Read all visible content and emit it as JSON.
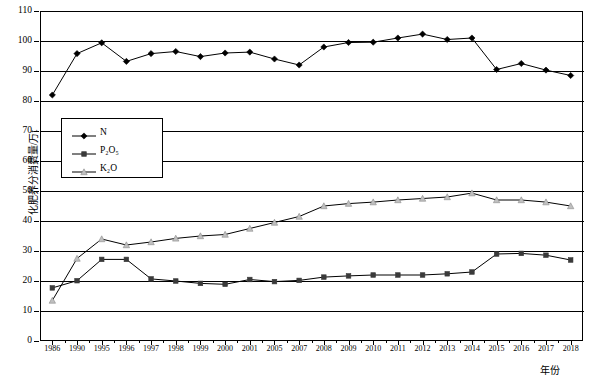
{
  "chart_data": {
    "type": "line",
    "title": "",
    "xlabel": "年份",
    "ylabel": "化肥养分消费量/万t",
    "ylim": [
      0,
      110
    ],
    "ytick_step": 10,
    "grid": true,
    "legend_position": "inside-upper-left",
    "categories": [
      "1986",
      "1990",
      "1995",
      "1996",
      "1997",
      "1998",
      "1999",
      "2000",
      "2001",
      "2005",
      "2007",
      "2008",
      "2009",
      "2010",
      "2011",
      "2012",
      "2013",
      "2014",
      "2015",
      "2016",
      "2017",
      "2018"
    ],
    "yticks": [
      "0",
      "10",
      "20",
      "30",
      "40",
      "50",
      "60",
      "70",
      "80",
      "90",
      "100",
      "110"
    ],
    "series": [
      {
        "name": "N",
        "marker": "diamond",
        "color": "#000000",
        "values": [
          82.0,
          95.8,
          99.4,
          93.2,
          95.8,
          96.5,
          94.8,
          96.0,
          96.3,
          94.0,
          92.0,
          98.0,
          99.5,
          99.6,
          101.0,
          102.3,
          100.5,
          101.0,
          90.5,
          92.5,
          90.3,
          88.5
        ]
      },
      {
        "name": "P2O5",
        "name_display": "P₂O₅",
        "marker": "square",
        "color": "#3a3a3a",
        "values": [
          17.7,
          20.1,
          27.2,
          27.2,
          20.7,
          20.0,
          19.2,
          18.9,
          20.5,
          19.8,
          20.2,
          21.3,
          21.7,
          22.0,
          22.0,
          22.0,
          22.4,
          23.0,
          29.0,
          29.2,
          28.6,
          27.0
        ]
      },
      {
        "name": "K2O",
        "name_display": "K₂O",
        "marker": "triangle",
        "color": "#bfbfbf",
        "values": [
          13.5,
          27.5,
          34.0,
          32.0,
          33.0,
          34.2,
          35.0,
          35.5,
          37.5,
          39.5,
          41.5,
          45.0,
          45.8,
          46.3,
          47.0,
          47.5,
          48.0,
          49.3,
          47.0,
          47.0,
          46.3,
          45.0
        ]
      }
    ],
    "legend": [
      {
        "label": "N",
        "marker": "diamond"
      },
      {
        "label": "P₂O₅",
        "marker": "square"
      },
      {
        "label": "K₂O",
        "marker": "triangle"
      }
    ]
  }
}
